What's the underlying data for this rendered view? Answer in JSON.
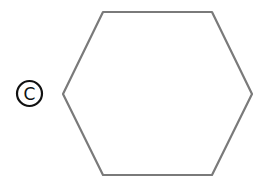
{
  "figure": {
    "label": "C",
    "label_style": "circled-letter",
    "shape": "hexagon",
    "stroke_color": "#7a7a7a",
    "label_color": "#111111"
  }
}
